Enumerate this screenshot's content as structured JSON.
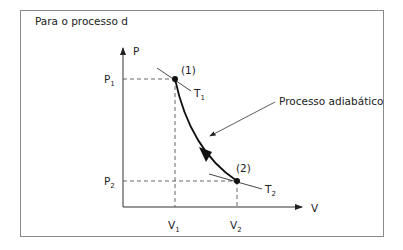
{
  "title": "Para o processo d",
  "axes": {
    "y_label": "P",
    "x_label": "V"
  },
  "points": [
    {
      "label": "(1)",
      "p": "P",
      "p_sub": "1",
      "v": "V",
      "v_sub": "1",
      "isotherm": "T",
      "isotherm_sub": "1"
    },
    {
      "label": "(2)",
      "p": "P",
      "p_sub": "2",
      "v": "V",
      "v_sub": "2",
      "isotherm": "T",
      "isotherm_sub": "2"
    }
  ],
  "annotation": "Processo adiabático",
  "colors": {
    "line": "#222222",
    "frame": "#8a8a8a",
    "dash": "#555555"
  }
}
